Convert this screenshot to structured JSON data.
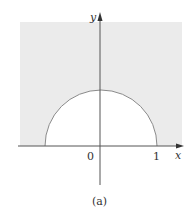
{
  "figure": {
    "caption": "(a)",
    "axes": {
      "x_label": "x",
      "y_label": "y",
      "tick_labels": {
        "origin": "0",
        "one": "1"
      }
    },
    "region": {
      "description": "Shaded region outside the upper unit semicircle, above x-axis",
      "shade_color": "#ebebeb",
      "curve_color": "#8a8a8a",
      "axis_color": "#555555"
    }
  }
}
